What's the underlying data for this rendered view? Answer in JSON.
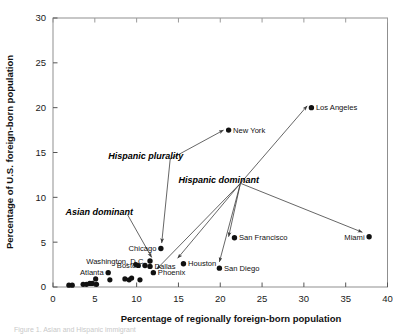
{
  "figure": {
    "background": "#ffffff",
    "frame_color": "#8f8f8f",
    "point_color": "#111111",
    "caption_partial": "Figure 1. Asian and Hispanic immigrant"
  },
  "chart_data": {
    "type": "scatter",
    "title": "",
    "xlabel": "Percentage of regionally foreign-born population",
    "ylabel": "Percentage of U.S. foreign-born population",
    "xlim": [
      0,
      40
    ],
    "ylim": [
      0,
      30
    ],
    "xticks": [
      0,
      5,
      10,
      15,
      20,
      25,
      30,
      35,
      40
    ],
    "yticks": [
      0,
      5,
      10,
      15,
      20,
      25,
      30
    ],
    "xticklabels": [
      "0",
      "5",
      "10",
      "15",
      "20",
      "25",
      "30",
      "35",
      "40"
    ],
    "yticklabels": [
      "0",
      "5",
      "10",
      "15",
      "20",
      "25",
      "30"
    ],
    "grid": false,
    "legend": null,
    "labeled_points": [
      {
        "label": "Los Angeles",
        "x": 30.9,
        "y": 20.0,
        "label_side": "right"
      },
      {
        "label": "New York",
        "x": 21.0,
        "y": 17.5,
        "label_side": "right"
      },
      {
        "label": "Miami",
        "x": 37.8,
        "y": 5.6,
        "label_side": "left"
      },
      {
        "label": "San Francisco",
        "x": 21.7,
        "y": 5.5,
        "label_side": "right"
      },
      {
        "label": "Chicago",
        "x": 12.9,
        "y": 4.3,
        "label_side": "left"
      },
      {
        "label": "Washington, D.C.",
        "x": 11.6,
        "y": 2.9,
        "label_side": "left"
      },
      {
        "label": "Houston",
        "x": 15.6,
        "y": 2.6,
        "label_side": "right"
      },
      {
        "label": "Dallas",
        "x": 11.6,
        "y": 2.3,
        "label_side": "right"
      },
      {
        "label": "Boston",
        "x": 11.0,
        "y": 2.4,
        "label_side": "left"
      },
      {
        "label": "San Diego",
        "x": 19.9,
        "y": 2.1,
        "label_side": "right"
      },
      {
        "label": "Phoenix",
        "x": 12.0,
        "y": 1.6,
        "label_side": "right"
      },
      {
        "label": "Atlanta",
        "x": 6.6,
        "y": 1.6,
        "label_side": "left"
      }
    ],
    "unlabeled_points": [
      {
        "x": 1.9,
        "y": 0.2
      },
      {
        "x": 2.3,
        "y": 0.2
      },
      {
        "x": 3.6,
        "y": 0.3
      },
      {
        "x": 4.0,
        "y": 0.3
      },
      {
        "x": 4.4,
        "y": 0.4
      },
      {
        "x": 4.7,
        "y": 0.4
      },
      {
        "x": 5.1,
        "y": 0.9
      },
      {
        "x": 5.2,
        "y": 0.3
      },
      {
        "x": 6.8,
        "y": 0.8
      },
      {
        "x": 8.6,
        "y": 0.9
      },
      {
        "x": 9.1,
        "y": 0.8
      },
      {
        "x": 9.4,
        "y": 1.0
      },
      {
        "x": 10.4,
        "y": 0.8
      },
      {
        "x": 9.9,
        "y": 2.5
      },
      {
        "x": 10.2,
        "y": 2.4
      }
    ],
    "annotations": [
      {
        "text": "Hispanic plurality",
        "text_x": 6.6,
        "text_y": 14.6,
        "arrows": [
          {
            "to_x": 20.4,
            "to_y": 17.5
          },
          {
            "to_x": 13.0,
            "to_y": 4.9
          }
        ]
      },
      {
        "text": "Hispanic dominant",
        "text_x": 15.0,
        "text_y": 11.9,
        "arrows": [
          {
            "to_x": 30.4,
            "to_y": 20.2
          },
          {
            "to_x": 37.0,
            "to_y": 6.1
          },
          {
            "to_x": 21.0,
            "to_y": 5.6
          },
          {
            "to_x": 19.9,
            "to_y": 2.8
          },
          {
            "to_x": 14.9,
            "to_y": 3.2
          },
          {
            "to_x": 12.4,
            "to_y": 2.0
          }
        ]
      },
      {
        "text": "Asian dominant",
        "text_x": 1.5,
        "text_y": 8.4,
        "arrows": [
          {
            "to_x": 11.8,
            "to_y": 3.3
          }
        ]
      }
    ]
  }
}
